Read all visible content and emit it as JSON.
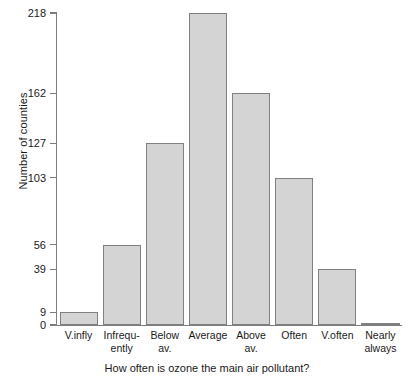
{
  "chart_data": {
    "type": "bar",
    "title": "",
    "xlabel": "How often is ozone the main air pollutant?",
    "ylabel": "Number of counties",
    "categories": [
      "V.infly",
      "Infrequently",
      "Below av.",
      "Average",
      "Above av.",
      "Often",
      "V.often",
      "Nearly always"
    ],
    "category_lines": [
      [
        "V.infly",
        ""
      ],
      [
        "Infrequ-",
        "ently"
      ],
      [
        "Below",
        "av."
      ],
      [
        "Average",
        ""
      ],
      [
        "Above",
        "av."
      ],
      [
        "Often",
        ""
      ],
      [
        "V.often",
        ""
      ],
      [
        "Nearly",
        "always"
      ]
    ],
    "values": [
      9,
      56,
      127,
      218,
      162,
      103,
      39,
      1
    ],
    "ylim": [
      0,
      218
    ],
    "ytick_values": [
      0,
      9,
      39,
      56,
      103,
      127,
      162,
      218
    ],
    "ytick_labels": [
      "0",
      "9",
      "39",
      "56",
      "103",
      "127",
      "162",
      "218"
    ],
    "grid": false,
    "legend": false,
    "bar_fill_color": "#d4d4d4",
    "bar_border_color": "#808080",
    "axis_color": "#7d7d7d"
  }
}
